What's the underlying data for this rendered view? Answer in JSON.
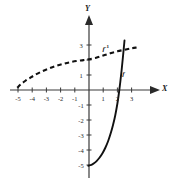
{
  "figure": {
    "background_color": "#ffffff",
    "axis_color": "#3a3a3a",
    "curve_color": "#111111"
  },
  "chart_data": {
    "type": "line",
    "title": "",
    "xlabel": "X",
    "ylabel": "Y",
    "xlim": [
      -5.6,
      3.6
    ],
    "ylim": [
      -5.6,
      3.4
    ],
    "grid": false,
    "legend": "inline-labels",
    "x_ticks": [
      -5,
      -4,
      -3,
      -2,
      -1,
      1,
      2,
      3
    ],
    "x_tick_labels": [
      "-5",
      "-4",
      "-3",
      "-2",
      "-1",
      "1",
      "2",
      "3"
    ],
    "y_ticks": [
      3,
      2,
      1,
      -1,
      -2,
      -3,
      -4,
      -5
    ],
    "y_tick_labels": [
      "3",
      "",
      "1",
      "-1",
      "-2",
      "-3",
      "-4",
      "-5"
    ],
    "series": [
      {
        "name": "f",
        "label": "f",
        "style": "solid",
        "description": "exponential-like increasing curve",
        "label_x": 2.35,
        "label_y": 1.0,
        "points": [
          [
            -0.05,
            -5.05
          ],
          [
            0.15,
            -5.0
          ],
          [
            0.35,
            -4.88
          ],
          [
            0.55,
            -4.72
          ],
          [
            0.75,
            -4.5
          ],
          [
            0.95,
            -4.22
          ],
          [
            1.15,
            -3.85
          ],
          [
            1.35,
            -3.4
          ],
          [
            1.55,
            -2.82
          ],
          [
            1.7,
            -2.3
          ],
          [
            1.85,
            -1.68
          ],
          [
            2.0,
            -0.9
          ],
          [
            2.1,
            -0.25
          ],
          [
            2.2,
            0.5
          ],
          [
            2.3,
            1.35
          ],
          [
            2.4,
            2.3
          ],
          [
            2.5,
            3.3
          ]
        ]
      },
      {
        "name": "f-inverse",
        "label": "f⁻¹",
        "label_base": "f",
        "label_exponent": "-1",
        "style": "dashed",
        "description": "logarithmic-like increasing curve, reflection of f",
        "label_x": 0.95,
        "label_y": 2.75,
        "points": [
          [
            -5.05,
            0.15
          ],
          [
            -4.8,
            0.38
          ],
          [
            -4.5,
            0.6
          ],
          [
            -4.2,
            0.78
          ],
          [
            -3.85,
            0.98
          ],
          [
            -3.4,
            1.2
          ],
          [
            -2.9,
            1.4
          ],
          [
            -2.4,
            1.58
          ],
          [
            -1.9,
            1.72
          ],
          [
            -1.4,
            1.84
          ],
          [
            -0.9,
            1.93
          ],
          [
            -0.4,
            1.99
          ],
          [
            0.0,
            2.05
          ],
          [
            0.5,
            2.15
          ],
          [
            1.0,
            2.3
          ],
          [
            1.5,
            2.45
          ],
          [
            2.0,
            2.58
          ],
          [
            2.5,
            2.68
          ],
          [
            3.0,
            2.78
          ],
          [
            3.35,
            2.83
          ]
        ]
      }
    ]
  },
  "labels": {
    "x_axis_letter": "X",
    "y_axis_letter": "Y"
  }
}
